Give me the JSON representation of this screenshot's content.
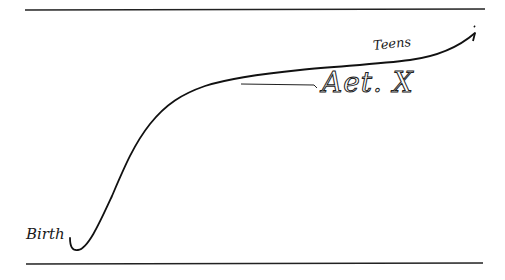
{
  "diagram": {
    "labels": {
      "start": "Birth",
      "end": "Teens",
      "marker": "Aet. X"
    },
    "colors": {
      "background": "#ffffff",
      "ink": "#1a1a1a"
    }
  }
}
